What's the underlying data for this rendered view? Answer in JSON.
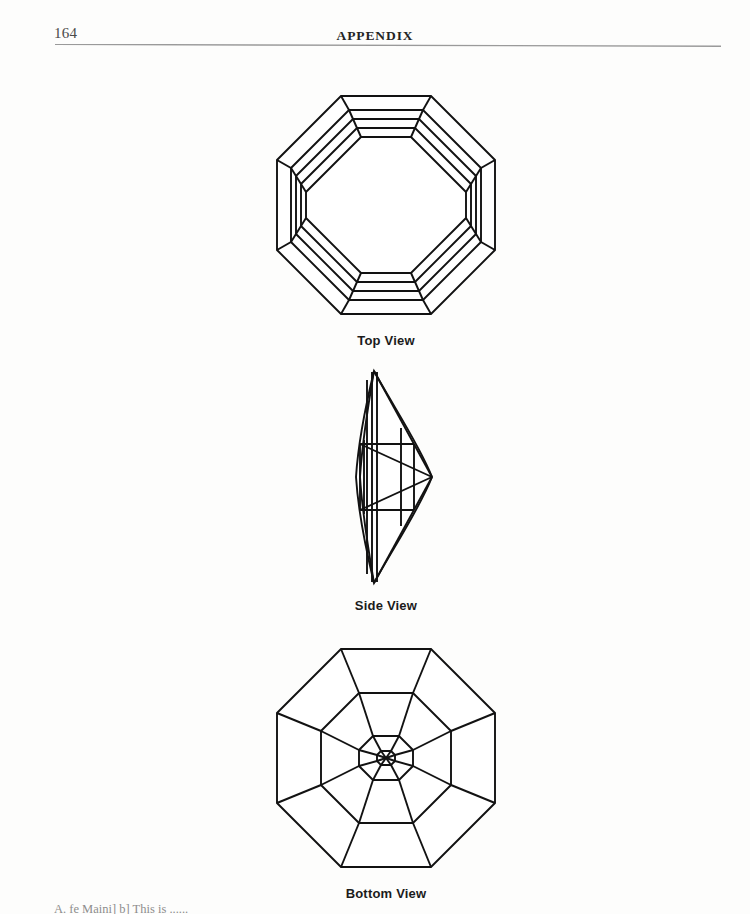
{
  "page": {
    "folio": "164",
    "running_head": "APPENDIX",
    "background_color": "#fdfdfc",
    "ink_color": "#121212",
    "rule_color": "#9a9a9a"
  },
  "figures": [
    {
      "id": "top-view",
      "caption": "Top View",
      "subject": "octagonal step-cut gemstone crown",
      "shape": "octagon",
      "sides": 8,
      "nested_rings": 4,
      "has_radial_corner_lines": true
    },
    {
      "id": "side-view",
      "caption": "Side View",
      "subject": "gemstone profile",
      "shape": "elongated lens / marquise profile",
      "has_girdle_line": true,
      "has_internal_facet_lines": true
    },
    {
      "id": "bottom-view",
      "caption": "Bottom View",
      "subject": "octagonal gemstone pavilion",
      "shape": "octagon",
      "sides": 8,
      "nested_rings": 3,
      "has_radial_lines_to_culet": true,
      "has_center_culet": true
    }
  ],
  "footer": {
    "cut_off_text": "A. fe Maini] b] This is ......"
  }
}
